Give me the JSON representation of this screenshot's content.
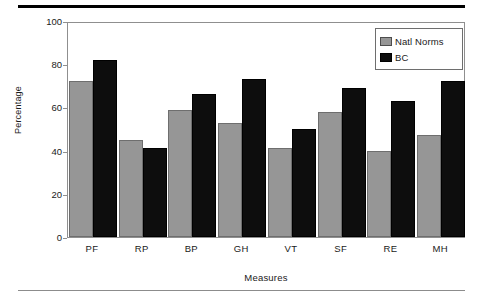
{
  "chart_data": {
    "type": "bar",
    "title": "",
    "xlabel": "Measures",
    "ylabel": "Percentage",
    "ylim": [
      0,
      100
    ],
    "yticks": [
      0,
      20,
      40,
      60,
      80,
      100
    ],
    "grid": false,
    "legend_position": "top-right",
    "categories": [
      "PF",
      "RP",
      "BP",
      "GH",
      "VT",
      "SF",
      "RE",
      "MH"
    ],
    "series": [
      {
        "name": "Natl Norms",
        "color": "#969696",
        "values": [
          72,
          45,
          59,
          53,
          41,
          58,
          40,
          47
        ]
      },
      {
        "name": "BC",
        "color": "#0d0d0d",
        "values": [
          82,
          41,
          66,
          73,
          50,
          69,
          63,
          72
        ]
      }
    ]
  },
  "legend": {
    "items": [
      {
        "label": "Natl Norms",
        "swatch": "gray-swatch"
      },
      {
        "label": "BC",
        "swatch": "black-swatch"
      }
    ]
  },
  "axes": {
    "y_title": "Percentage",
    "x_title": "Measures",
    "y_tick_labels": [
      "100",
      "80",
      "60",
      "40",
      "20",
      "0"
    ],
    "x_tick_labels": [
      "PF",
      "RP",
      "BP",
      "GH",
      "VT",
      "SF",
      "RE",
      "MH"
    ]
  },
  "colors": {
    "natl_norms": "#969696",
    "bc": "#0d0d0d",
    "frame": "#8f8f8f",
    "rule_top": "#000000",
    "rule_bottom": "#8c8c8c"
  }
}
